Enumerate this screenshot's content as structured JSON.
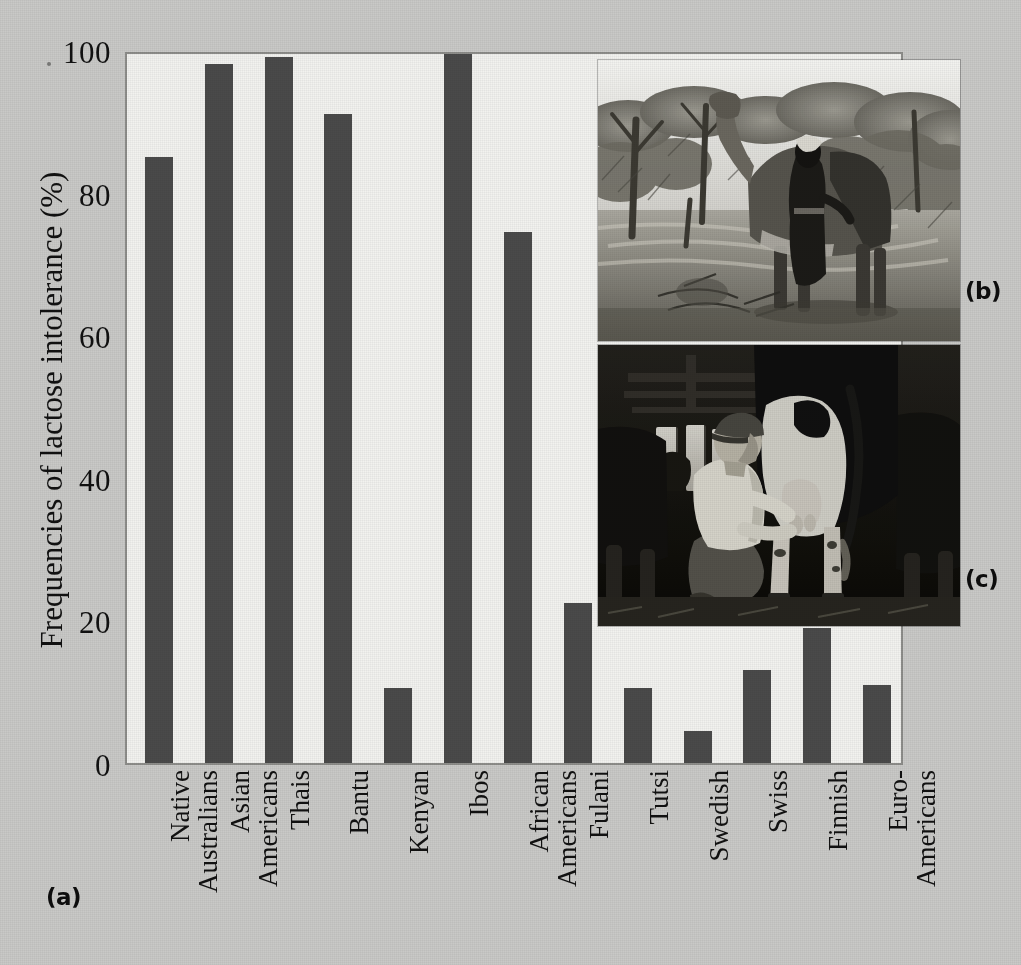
{
  "figure": {
    "panel_a_label": "(a)",
    "panel_b_label": "(b)",
    "panel_c_label": "(c)"
  },
  "photos": {
    "b": {
      "name": "camel-milking-photo",
      "caption_letter": "(b)",
      "description": "Black and white photograph of a camel standing among acacia trees in dry scrubland, being milked by a person in dark robes"
    },
    "c": {
      "name": "cow-milking-photo",
      "caption_letter": "(c)",
      "description": "Black and white photograph of a man in a white shirt and cap crouching in a barn to hand-milk a Holstein dairy cow"
    }
  },
  "chart_data": {
    "type": "bar",
    "title": "",
    "xlabel": "",
    "ylabel": "Frequencies of lactose intolerance (%)",
    "ylim": [
      0,
      100
    ],
    "yticks": [
      0,
      20,
      40,
      60,
      80,
      100
    ],
    "ytick_labels": [
      "0",
      "20",
      "40",
      "60",
      "80",
      "100"
    ],
    "grid": false,
    "legend": "none",
    "bar_color": "#4a4a4a",
    "plot_background": "#f2f2ef",
    "categories": [
      "Native Australians",
      "Asian Americans",
      "Thais",
      "Bantu",
      "Kenyan",
      "Ibos",
      "African Americans",
      "Fulani",
      "Tutsi",
      "Swedish",
      "Swiss",
      "Finnish",
      "Euro-Americans"
    ],
    "category_lines": [
      [
        "Native",
        "Australians"
      ],
      [
        "Asian",
        "Americans"
      ],
      [
        "Thais",
        ""
      ],
      [
        "Bantu",
        ""
      ],
      [
        "Kenyan",
        ""
      ],
      [
        "Ibos",
        ""
      ],
      [
        "African",
        "Americans"
      ],
      [
        "Fulani",
        ""
      ],
      [
        "Tutsi",
        ""
      ],
      [
        "Swedish",
        ""
      ],
      [
        "Swiss",
        ""
      ],
      [
        "Finnish",
        ""
      ],
      [
        "Euro-",
        "Americans"
      ]
    ],
    "values": [
      85,
      98,
      99,
      91,
      10.5,
      99.5,
      74.5,
      22.5,
      10.5,
      4.5,
      13,
      19,
      11
    ]
  }
}
